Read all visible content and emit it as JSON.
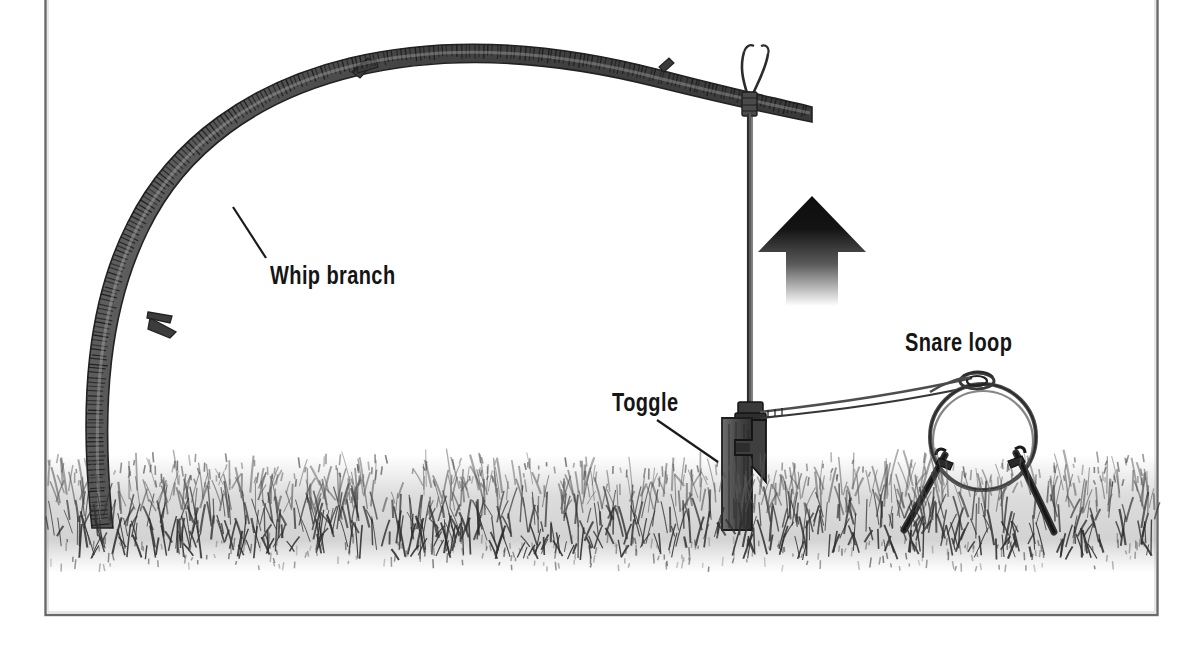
{
  "figure": {
    "type": "line-illustration",
    "frame": {
      "visible": true,
      "color": "#5a5a5a",
      "x": 45,
      "y": -6,
      "width": 1113,
      "height": 621
    },
    "background_color": "#ffffff",
    "ink_color": "#2b2b2b",
    "label_color": "#151515"
  },
  "labels": [
    {
      "id": "whip-branch",
      "text": "Whip branch",
      "x": 270,
      "y": 263,
      "leader": {
        "from_x": 266,
        "from_y": 258,
        "to_x": 233,
        "to_y": 207
      }
    },
    {
      "id": "toggle",
      "text": "Toggle",
      "x": 612,
      "y": 390,
      "leader": {
        "from_x": 657,
        "from_y": 420,
        "to_x": 718,
        "to_y": 462
      }
    },
    {
      "id": "snare-loop",
      "text": "Snare loop",
      "x": 905,
      "y": 330,
      "leader": null
    }
  ],
  "components": {
    "whip_branch": {
      "name": "Whip branch",
      "description": "Long springy sapling bent in an arc, anchored in the ground at left",
      "color": "#4a4a4a",
      "bark_texture": "hatched",
      "base_x": 92,
      "base_y": 525,
      "tip_x": 812,
      "tip_y": 108,
      "twig_stubs": 4
    },
    "cord": {
      "name": "Cord",
      "description": "Vertical line from branch tip down to the toggle",
      "color": "#3a3a3a",
      "top_x": 750,
      "top_y": 85,
      "bottom_x": 750,
      "bottom_y": 410,
      "knot_at_branch": true
    },
    "toggle": {
      "name": "Toggle",
      "description": "Notched wooden toggle engaged against a driven stake",
      "color": "#565656",
      "x": 722,
      "y": 418,
      "width": 30,
      "height": 110
    },
    "snare_wire": {
      "name": "Snare wire",
      "description": "Double-strand wire running from the toggle to the slip knot of the loop",
      "color": "#4a4a4a",
      "from_x": 755,
      "from_y": 412,
      "to_x": 975,
      "to_y": 382
    },
    "snare_loop": {
      "name": "Snare loop",
      "description": "Wire noose held open in a circle above the ground",
      "color": "#4a4a4a",
      "center_x": 983,
      "center_y": 437,
      "radius": 53,
      "slip_knot_x": 978,
      "slip_knot_y": 381
    },
    "support_stakes": {
      "name": "Support stakes",
      "description": "Two forked sticks angled outward holding the loop open",
      "count": 2,
      "color": "#3d3d3d",
      "left_top_x": 944,
      "left_top_y": 460,
      "left_bottom_x": 906,
      "left_bottom_y": 528,
      "right_top_x": 1014,
      "right_top_y": 458,
      "right_bottom_x": 1052,
      "right_bottom_y": 532
    },
    "direction_arrow": {
      "name": "Direction arrow",
      "description": "Solid black arrow pointing up, indicating the snap direction",
      "color": "#1a1a1a",
      "x": 812,
      "y": 200,
      "width": 56,
      "height": 100,
      "points": "up",
      "fades_at_tail": true
    },
    "ground": {
      "name": "Ground",
      "description": "Band of hand-drawn grass across the lower portion",
      "color": "#6e6e6e",
      "top_y": 462,
      "bottom_y": 560,
      "blade_count": 520
    }
  }
}
